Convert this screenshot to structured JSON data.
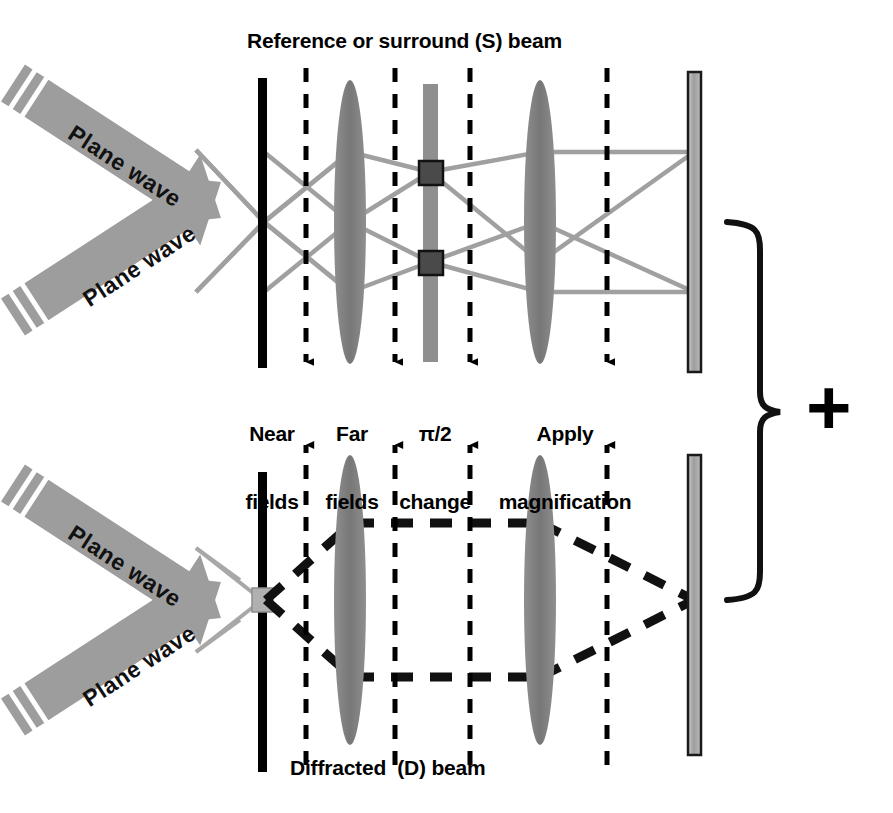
{
  "figure": {
    "type": "optical-ray-diagram",
    "title_top": "Reference or surround (S) beam",
    "title_bottom": "Diffracted  (D) beam",
    "combine_symbol": "+",
    "background_color": "#ffffff",
    "ink_color": "#000000",
    "ray_color": "#9a9a9a",
    "element_gray": "#8c8c8c",
    "element_dark": "#4a4a4a"
  },
  "steps": [
    {
      "id": "near-fields",
      "line1": "Near",
      "line2": "fields"
    },
    {
      "id": "far-fields",
      "line1": "Far",
      "line2": "fields"
    },
    {
      "id": "pi-over-two-change",
      "line1": "π/2",
      "line2": "change"
    },
    {
      "id": "apply-magnification",
      "line1": "Apply",
      "line2": "magnification"
    }
  ],
  "beams": {
    "surround": {
      "label": "Reference or surround (S) beam",
      "style": "solid-gray-rays",
      "sources": [
        {
          "id": "plane-wave-upper",
          "label": "Plane wave",
          "angle_deg": 33
        },
        {
          "id": "plane-wave-lower",
          "label": "Plane wave",
          "angle_deg": -33
        }
      ]
    },
    "diffracted": {
      "label": "Diffracted  (D) beam",
      "style": "thick-black-dashed",
      "sources": [
        {
          "id": "plane-wave-upper",
          "label": "Plane wave",
          "angle_deg": 33
        },
        {
          "id": "plane-wave-lower",
          "label": "Plane wave",
          "angle_deg": -33
        }
      ]
    }
  },
  "optical_elements": [
    {
      "id": "sample-plane",
      "name": "sample",
      "kind": "bar-black"
    },
    {
      "id": "near-field-plane",
      "name": "near field plane",
      "kind": "dashed-axis"
    },
    {
      "id": "objective-lens",
      "name": "lens",
      "kind": "lens"
    },
    {
      "id": "far-field-plane",
      "name": "far field plane",
      "kind": "dashed-axis"
    },
    {
      "id": "phase-plate",
      "name": "phase plate",
      "kind": "plate-with-patches"
    },
    {
      "id": "post-plate-plane",
      "name": "plane after phase plate",
      "kind": "dashed-axis"
    },
    {
      "id": "imaging-lens",
      "name": "lens",
      "kind": "lens"
    },
    {
      "id": "magnification-plane",
      "name": "magnification plane",
      "kind": "dashed-axis"
    },
    {
      "id": "detector-screen",
      "name": "image plane / detector",
      "kind": "screen"
    }
  ]
}
